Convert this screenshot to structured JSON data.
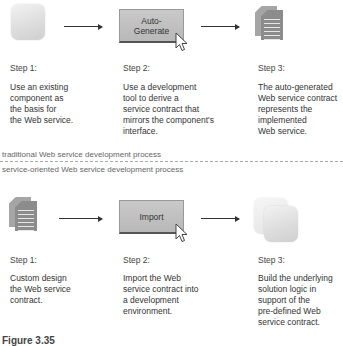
{
  "traditional": {
    "label": "traditional Web service development process",
    "steps": [
      {
        "label": "Step 1:",
        "description": "Use an existing\ncomponent as\nthe basis for\nthe Web service.",
        "icon": "component-icon"
      },
      {
        "label": "Step 2:",
        "description": "Use a development\ntool to derive a\nservice contract that\nmirrors the component's\ninterface.",
        "icon": "auto-generate-button",
        "button_label": "Auto-\nGenerate"
      },
      {
        "label": "Step 3:",
        "description": "The auto-generated\nWeb service contract\nrepresents the\nimplemented\nWeb service.",
        "icon": "document-icon"
      }
    ]
  },
  "service_oriented": {
    "label": "service-oriented Web service development process",
    "steps": [
      {
        "label": "Step 1:",
        "description": "Custom design\nthe Web service\ncontract.",
        "icon": "document-icon"
      },
      {
        "label": "Step 2:",
        "description": "Import the Web\nservice contract into\na development\nenvironment.",
        "icon": "import-button",
        "button_label": "Import"
      },
      {
        "label": "Step 3:",
        "description": "Build the underlying\nsolution logic in\nsupport of the\npre-defined Web\nservice contract.",
        "icon": "stacked-components-icon"
      }
    ]
  },
  "caption": "Figure 3.35"
}
